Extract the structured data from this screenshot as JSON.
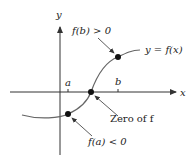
{
  "diagram": {
    "axis_labels": {
      "x": "x",
      "y": "y"
    },
    "ticks": {
      "a": "a",
      "b": "b"
    },
    "curve_label": "y = f(x)",
    "annotations": {
      "fb": "f(b) > 0",
      "fa": "f(a) < 0",
      "zero": "Zero of f"
    },
    "colors": {
      "curve": "#555555",
      "axis": "#333333",
      "point": "#111111"
    }
  }
}
